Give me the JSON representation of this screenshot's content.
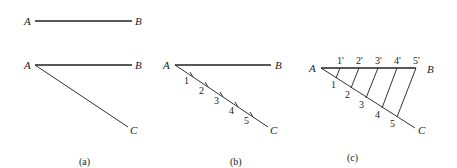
{
  "figure": {
    "panels": [
      {
        "id": "a",
        "caption": "(a)",
        "top_segment": {
          "start_label": "A",
          "end_label": "B"
        },
        "angle": {
          "vertex_label": "A",
          "ray1_label": "B",
          "ray2_label": "C"
        }
      },
      {
        "id": "b",
        "caption": "(b)",
        "labels": {
          "a": "A",
          "b": "B",
          "c": "C"
        },
        "divisions": [
          "1",
          "2",
          "3",
          "4",
          "5"
        ]
      },
      {
        "id": "c",
        "caption": "(c)",
        "labels": {
          "a": "A",
          "b": "B",
          "c": "C"
        },
        "divisions": [
          "1",
          "2",
          "3",
          "4",
          "5"
        ],
        "projected_divisions": [
          "1'",
          "2'",
          "3'",
          "4'",
          "5'"
        ]
      }
    ]
  }
}
